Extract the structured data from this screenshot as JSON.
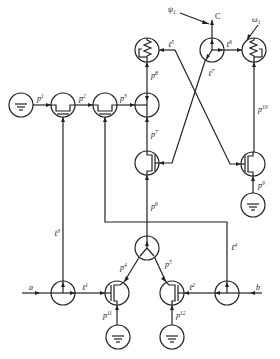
{
  "diagram": {
    "type": "bond-graph / pneumatic network schematic",
    "ports": {
      "left": "a",
      "right": "b",
      "output": "C"
    },
    "inputs": {
      "psi": "ψ",
      "psi_sub": "1",
      "omega": "ω",
      "omega_sub": "1"
    },
    "labels": {
      "p1": {
        "base": "p",
        "sup": "1"
      },
      "p2": {
        "base": "p",
        "sup": "2"
      },
      "p3": {
        "base": "p",
        "sup": "3"
      },
      "p4": {
        "base": "p",
        "sup": "4"
      },
      "p5": {
        "base": "p",
        "sup": "5"
      },
      "p6": {
        "base": "p",
        "sup": "6"
      },
      "p7": {
        "base": "p",
        "sup": "7"
      },
      "p8": {
        "base": "p",
        "sup": "8"
      },
      "p9": {
        "base": "p",
        "sup": "9"
      },
      "p10": {
        "base": "p",
        "sup": "10"
      },
      "p11": {
        "base": "p",
        "sup": "11"
      },
      "p12": {
        "base": "p",
        "sup": "12"
      },
      "e1": {
        "base": "ℓ",
        "sup": "1"
      },
      "e2": {
        "base": "ℓ",
        "sup": "2"
      },
      "e3": {
        "base": "ℓ",
        "sup": "3"
      },
      "e4": {
        "base": "ℓ",
        "sup": "4"
      },
      "e5": {
        "base": "ℓ",
        "sup": "5"
      },
      "e6": {
        "base": "ℓ",
        "sup": "6"
      },
      "e7": {
        "base": "ℓ",
        "sup": "7"
      }
    },
    "nodes": [
      {
        "id": "ground-1",
        "kind": "ground",
        "x": 21,
        "y": 105
      },
      {
        "id": "valve-1",
        "kind": "valve",
        "x": 63,
        "y": 105
      },
      {
        "id": "valve-2",
        "kind": "valve",
        "x": 105,
        "y": 105
      },
      {
        "id": "junction-top",
        "kind": "junction",
        "x": 147,
        "y": 105
      },
      {
        "id": "resistor-left",
        "kind": "resistor",
        "x": 147,
        "y": 50
      },
      {
        "id": "junction-3way-top",
        "kind": "three-way",
        "x": 212,
        "y": 50
      },
      {
        "id": "resistor-right",
        "kind": "resistor",
        "x": 254,
        "y": 50
      },
      {
        "id": "transistor-left",
        "kind": "transistor",
        "x": 147,
        "y": 163
      },
      {
        "id": "transistor-right",
        "kind": "transistor",
        "x": 253,
        "y": 164
      },
      {
        "id": "ground-2",
        "kind": "ground",
        "x": 253,
        "y": 205
      },
      {
        "id": "junction-3way-bottom",
        "kind": "three-way",
        "x": 147,
        "y": 248
      },
      {
        "id": "junction-bottom-left",
        "kind": "junction",
        "x": 63,
        "y": 293
      },
      {
        "id": "transistor-bottom-left",
        "kind": "transistor",
        "x": 117,
        "y": 293
      },
      {
        "id": "transistor-bottom-right",
        "kind": "transistor",
        "x": 172,
        "y": 293
      },
      {
        "id": "junction-bottom-right",
        "kind": "junction",
        "x": 227,
        "y": 293
      },
      {
        "id": "ground-3",
        "kind": "ground",
        "x": 118,
        "y": 337
      },
      {
        "id": "ground-4",
        "kind": "ground",
        "x": 172,
        "y": 337
      }
    ]
  }
}
